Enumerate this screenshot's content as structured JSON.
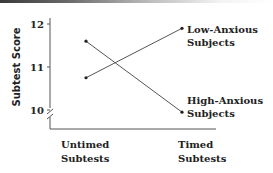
{
  "chart_data": {
    "type": "line",
    "title": "",
    "xlabel": "",
    "ylabel": "Subtest Score",
    "categories": [
      "Untimed Subtests",
      "Timed Subtests"
    ],
    "category_lines": [
      [
        "Untimed",
        "Subtests"
      ],
      [
        "Timed",
        "Subtests"
      ]
    ],
    "y_ticks": [
      10,
      11,
      12
    ],
    "ylim": [
      10,
      12
    ],
    "y_axis_break": true,
    "grid": false,
    "legend_position": "inline-right",
    "series": [
      {
        "name": "Low-Anxious Subjects",
        "label_lines": [
          "Low-Anxious",
          "Subjects"
        ],
        "values": [
          10.75,
          11.9
        ]
      },
      {
        "name": "High-Anxious Subjects",
        "label_lines": [
          "High-Anxious",
          "Subjects"
        ],
        "values": [
          11.6,
          9.95
        ]
      }
    ]
  },
  "colors": {
    "line": "#555555",
    "text": "#222222",
    "axis": "#555555"
  }
}
